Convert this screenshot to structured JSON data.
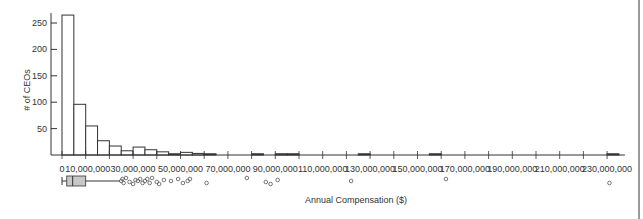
{
  "chart_data": {
    "type": "bar",
    "subtype": "histogram_with_boxplot",
    "title": "",
    "xlabel": "Annual Compensation ($)",
    "ylabel": "# of CEOs",
    "bin_width": 5000000,
    "bin_starts": [
      0,
      5000000,
      10000000,
      15000000,
      20000000,
      25000000,
      30000000,
      35000000,
      40000000,
      45000000,
      50000000,
      55000000,
      60000000,
      65000000,
      70000000,
      75000000,
      80000000,
      85000000,
      90000000,
      95000000,
      100000000,
      105000000,
      110000000,
      115000000,
      120000000,
      125000000,
      130000000,
      135000000,
      140000000,
      145000000,
      150000000,
      155000000,
      160000000,
      165000000,
      170000000,
      175000000,
      180000000,
      185000000,
      190000000,
      195000000,
      200000000,
      205000000,
      210000000,
      215000000,
      220000000,
      225000000,
      230000000
    ],
    "values": [
      265,
      96,
      55,
      27,
      17,
      8,
      15,
      10,
      6,
      2,
      5,
      3,
      1,
      0,
      0,
      0,
      1,
      0,
      2,
      1,
      0,
      0,
      0,
      0,
      0,
      1,
      0,
      0,
      0,
      0,
      0,
      1,
      0,
      0,
      0,
      0,
      0,
      0,
      0,
      0,
      0,
      0,
      0,
      0,
      0,
      0,
      1
    ],
    "xlim": [
      0,
      235000000
    ],
    "ylim": [
      0,
      265
    ],
    "y_ticks": [
      50,
      100,
      150,
      200,
      250
    ],
    "x_ticks": [
      0,
      10000000,
      30000000,
      50000000,
      70000000,
      90000000,
      110000000,
      130000000,
      150000000,
      170000000,
      190000000,
      210000000,
      230000000
    ],
    "x_tick_labels": [
      "0",
      "10,000,000",
      "30,000,000",
      "50,000,000",
      "70,000,000",
      "90,000,000",
      "110,000,000",
      "130,000,000",
      "150,000,000",
      "170,000,000",
      "190,000,000",
      "210,000,000",
      "230,000,000"
    ],
    "grid": false,
    "legend": null,
    "boxplot": {
      "whisker_low": 0,
      "q1": 2000000,
      "median": 4500000,
      "q3": 10000000,
      "whisker_high": 24500000,
      "outliers": [
        25000000,
        25500000,
        26000000,
        27000000,
        28500000,
        30000000,
        31000000,
        32000000,
        33000000,
        34000000,
        35000000,
        36000000,
        37000000,
        38000000,
        40000000,
        41000000,
        43000000,
        46000000,
        49000000,
        51000000,
        53000000,
        54000000,
        61000000,
        78000000,
        86000000,
        88000000,
        91000000,
        122000000,
        162000000,
        231000000
      ]
    }
  }
}
